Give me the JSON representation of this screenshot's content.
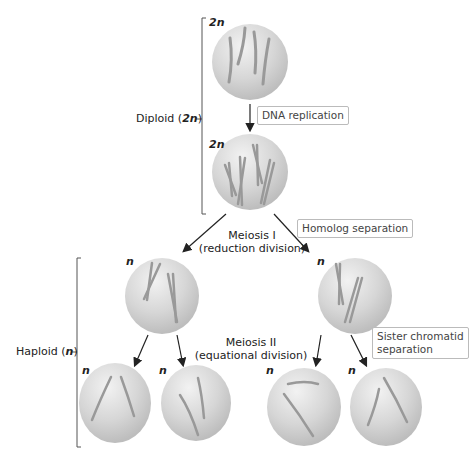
{
  "labels": {
    "diploid": "Diploid (",
    "diploid_n": "2n",
    "diploid_close": ")",
    "haploid": "Haploid (",
    "haploid_n": "n",
    "haploid_close": ")",
    "meiosis1_line1": "Meiosis I",
    "meiosis1_line2": "(reduction division)",
    "meiosis2_line1": "Meiosis II",
    "meiosis2_line2": "(equational division)"
  },
  "boxes": {
    "dna_replication": "DNA replication",
    "homolog_separation": "Homolog separation",
    "sister_line1": "Sister chromatid",
    "sister_line2": "separation"
  },
  "ploidy": {
    "cell1": "2n",
    "cell2": "2n",
    "cell3": "n",
    "cell4": "n",
    "cell5": "n",
    "cell6": "n",
    "cell7": "n",
    "cell8": "n"
  },
  "colors": {
    "cell": "#d4d4d4",
    "chromosome": "#9a9a9a",
    "line": "#555555"
  }
}
